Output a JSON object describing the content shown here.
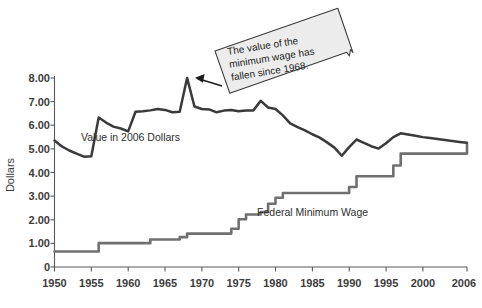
{
  "chart_data": {
    "type": "line",
    "title": "",
    "subtitle": "",
    "xlabel": "",
    "ylabel": "Dollars",
    "xlim": [
      1950,
      2006
    ],
    "ylim": [
      0,
      8
    ],
    "grid": false,
    "legend_position": "inline-labels",
    "x_tick_labels": [
      "1950",
      "1955",
      "1960",
      "1965",
      "1970",
      "1975",
      "1980",
      "1985",
      "1990",
      "1995",
      "2000",
      "2006"
    ],
    "x_tick_values": [
      1950,
      1955,
      1960,
      1965,
      1970,
      1975,
      1980,
      1985,
      1990,
      1995,
      2000,
      2006
    ],
    "y_tick_labels": [
      "0",
      "1.00",
      "2.00",
      "3.00",
      "4.00",
      "5.00",
      "6.00",
      "7.00",
      "8.00"
    ],
    "y_tick_values": [
      0,
      1,
      2,
      3,
      4,
      5,
      6,
      7,
      8
    ],
    "series": [
      {
        "name": "Value in 2006 Dollars",
        "label": "Value in 2006 Dollars",
        "color": "#3a3a3a",
        "style": "line",
        "label_x": 1953.6,
        "label_y": 5.27,
        "x": [
          1950,
          1951,
          1952,
          1953,
          1954,
          1955,
          1956,
          1957,
          1958,
          1959,
          1960,
          1961,
          1962,
          1963,
          1964,
          1965,
          1966,
          1967,
          1968,
          1969,
          1970,
          1971,
          1972,
          1973,
          1974,
          1975,
          1976,
          1977,
          1978,
          1979,
          1980,
          1981,
          1982,
          1983,
          1984,
          1985,
          1986,
          1987,
          1988,
          1989,
          1990,
          1991,
          1992,
          1993,
          1994,
          1995,
          1996,
          1997,
          1998,
          1999,
          2000,
          2001,
          2002,
          2003,
          2004,
          2005,
          2006
        ],
        "y": [
          5.3,
          5.05,
          4.88,
          4.75,
          4.62,
          4.64,
          6.26,
          6.05,
          5.88,
          5.8,
          5.68,
          6.5,
          6.52,
          6.56,
          6.62,
          6.58,
          6.48,
          6.5,
          7.92,
          6.72,
          6.62,
          6.6,
          6.48,
          6.55,
          6.58,
          6.52,
          6.55,
          6.56,
          6.96,
          6.68,
          6.62,
          6.35,
          6.02,
          5.86,
          5.72,
          5.56,
          5.42,
          5.22,
          5.0,
          4.66,
          5.02,
          5.34,
          5.2,
          5.06,
          4.96,
          5.18,
          5.44,
          5.6,
          5.55,
          5.5,
          5.44,
          5.4,
          5.36,
          5.32,
          5.28,
          5.24,
          5.2
        ]
      },
      {
        "name": "Federal Minimum Wage",
        "label": "Federal Minimum Wage",
        "color": "#707070",
        "style": "step",
        "label_x": 1977.5,
        "label_y": 2.13,
        "x": [
          1950,
          1954,
          1956,
          1961,
          1963,
          1967,
          1968,
          1974,
          1975,
          1976,
          1978,
          1979,
          1980,
          1981,
          1990,
          1991,
          1996,
          1997,
          2006
        ],
        "y": [
          0.65,
          0.65,
          1.0,
          1.0,
          1.15,
          1.25,
          1.4,
          1.6,
          2.0,
          2.2,
          2.3,
          2.65,
          2.9,
          3.1,
          3.35,
          3.8,
          4.25,
          4.75,
          5.15
        ]
      }
    ],
    "annotations": [
      {
        "id": "callout-1",
        "text_lines": [
          "The value of the",
          "minimum wage has",
          "fallen since 1968."
        ],
        "text": "The value of the minimum wage has fallen since 1968.",
        "points_to_x": 1968,
        "points_to_y": 7.92,
        "fill": "#ececec",
        "border": "#3a3a3a",
        "rotation_deg": -9
      }
    ]
  }
}
